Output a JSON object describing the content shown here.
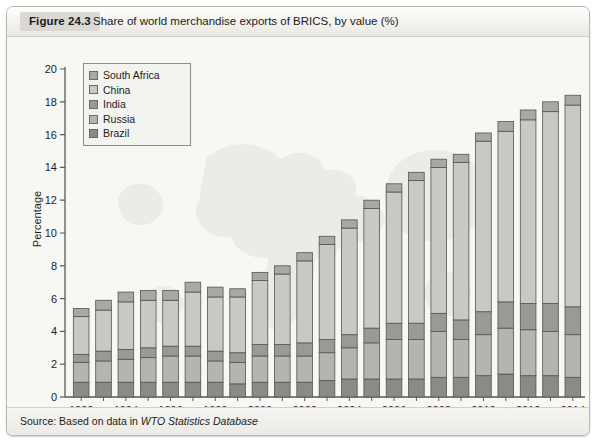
{
  "figure": {
    "tag": "Figure 24.3",
    "title": "Share of world merchandise exports of BRICS, by value (%)",
    "source_prefix": "Source: Based on data in ",
    "source_italic": "WTO Statistics Database"
  },
  "legend": {
    "position": "inside-top-left",
    "items": [
      {
        "label": "South Africa",
        "color": "#a9a9a4"
      },
      {
        "label": "China",
        "color": "#c9c9c4"
      },
      {
        "label": "India",
        "color": "#9a9a95"
      },
      {
        "label": "Russia",
        "color": "#b5b5b0"
      },
      {
        "label": "Brazil",
        "color": "#8b8b86"
      }
    ]
  },
  "chart_data": {
    "type": "bar",
    "stacked": true,
    "title": "Share of world merchandise exports of BRICS, by value (%)",
    "xlabel": "",
    "ylabel": "Percentage",
    "ylim": [
      0,
      20
    ],
    "ytick_step": 2,
    "yticks": [
      0,
      2,
      4,
      6,
      8,
      10,
      12,
      14,
      16,
      18,
      20
    ],
    "grid": false,
    "legend_position": "upper left",
    "x": [
      1992,
      1993,
      1994,
      1995,
      1996,
      1997,
      1998,
      1999,
      2000,
      2001,
      2002,
      2003,
      2004,
      2005,
      2006,
      2007,
      2008,
      2009,
      2010,
      2011,
      2012,
      2013,
      2014
    ],
    "xtick_labels": [
      "1992",
      "",
      "1994",
      "",
      "1996",
      "",
      "1998",
      "",
      "2000",
      "",
      "2002",
      "",
      "2004",
      "",
      "2006",
      "",
      "2008",
      "",
      "2010",
      "",
      "2012",
      "",
      "2014"
    ],
    "categories": [
      "1992",
      "1993",
      "1994",
      "1995",
      "1996",
      "1997",
      "1998",
      "1999",
      "2000",
      "2001",
      "2002",
      "2003",
      "2004",
      "2005",
      "2006",
      "2007",
      "2008",
      "2009",
      "2010",
      "2011",
      "2012",
      "2013",
      "2014"
    ],
    "series": [
      {
        "name": "Brazil",
        "color": "#8b8b86",
        "values": [
          0.9,
          0.9,
          0.9,
          0.9,
          0.9,
          0.9,
          0.9,
          0.8,
          0.9,
          0.9,
          0.9,
          1.0,
          1.1,
          1.1,
          1.1,
          1.1,
          1.2,
          1.2,
          1.3,
          1.4,
          1.3,
          1.3,
          1.2
        ]
      },
      {
        "name": "Russia",
        "color": "#b5b5b0",
        "values": [
          1.2,
          1.3,
          1.4,
          1.5,
          1.6,
          1.6,
          1.3,
          1.3,
          1.6,
          1.6,
          1.6,
          1.7,
          1.9,
          2.2,
          2.4,
          2.4,
          2.8,
          2.3,
          2.5,
          2.8,
          2.8,
          2.7,
          2.6
        ]
      },
      {
        "name": "India",
        "color": "#9a9a95",
        "values": [
          0.5,
          0.6,
          0.6,
          0.6,
          0.6,
          0.6,
          0.6,
          0.6,
          0.7,
          0.7,
          0.8,
          0.8,
          0.8,
          0.9,
          1.0,
          1.0,
          1.1,
          1.2,
          1.4,
          1.6,
          1.6,
          1.7,
          1.7
        ]
      },
      {
        "name": "China",
        "color": "#c9c9c4",
        "values": [
          2.3,
          2.5,
          2.9,
          2.9,
          2.8,
          3.3,
          3.3,
          3.4,
          3.9,
          4.3,
          5.0,
          5.8,
          6.5,
          7.3,
          8.0,
          8.7,
          8.9,
          9.6,
          10.4,
          10.4,
          11.2,
          11.7,
          12.3
        ]
      },
      {
        "name": "South Africa",
        "color": "#a9a9a4",
        "values": [
          0.5,
          0.6,
          0.6,
          0.6,
          0.6,
          0.6,
          0.6,
          0.5,
          0.5,
          0.5,
          0.5,
          0.5,
          0.5,
          0.5,
          0.5,
          0.5,
          0.5,
          0.5,
          0.5,
          0.6,
          0.6,
          0.6,
          0.6
        ]
      }
    ],
    "totals": [
      5.4,
      5.9,
      6.4,
      6.5,
      6.5,
      7.0,
      6.7,
      6.6,
      7.6,
      8.0,
      8.8,
      9.8,
      10.8,
      12.0,
      13.0,
      13.7,
      14.5,
      14.8,
      16.1,
      16.8,
      17.5,
      18.0,
      18.4
    ]
  }
}
